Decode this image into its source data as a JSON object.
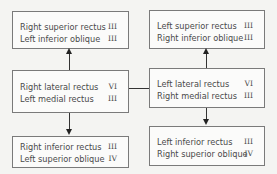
{
  "left_column": {
    "top": {
      "rows": [
        {
          "muscle": "Right superior rectus",
          "nerve": "III"
        },
        {
          "muscle": "Left inferior oblique",
          "nerve": "III"
        }
      ]
    },
    "middle": {
      "rows": [
        {
          "muscle": "Right lateral rectus",
          "nerve": "VI"
        },
        {
          "muscle": "Left medial rectus",
          "nerve": "III"
        }
      ]
    },
    "bottom": {
      "rows": [
        {
          "muscle": "Right inferior rectus",
          "nerve": "III"
        },
        {
          "muscle": "Left superior oblique",
          "nerve": "IV"
        }
      ]
    }
  },
  "right_column": {
    "top": {
      "rows": [
        {
          "muscle": "Left superior rectus",
          "nerve": "III"
        },
        {
          "muscle": "Right inferior oblique",
          "nerve": "III"
        }
      ]
    },
    "middle": {
      "rows": [
        {
          "muscle": "Left lateral rectus",
          "nerve": "VI"
        },
        {
          "muscle": "Right medial rectus",
          "nerve": "III"
        }
      ]
    },
    "bottom": {
      "rows": [
        {
          "muscle": "Left inferior rectus",
          "nerve": "III"
        },
        {
          "muscle": "Right superior oblique",
          "nerve": "IV"
        }
      ]
    }
  }
}
